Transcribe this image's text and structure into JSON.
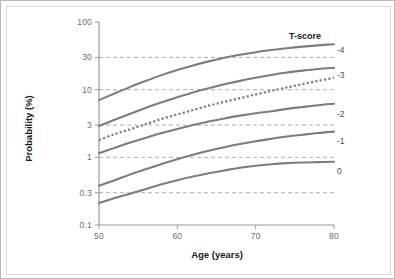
{
  "figure": {
    "border_color": "#b9b9b9",
    "inner_border_color": "#d8d8d8",
    "background": "#ffffff"
  },
  "legend": {
    "title": "T-score"
  },
  "chart_data": {
    "type": "line",
    "title": "",
    "subtitle": "",
    "xlabel": "Age (years)",
    "ylabel": "Probability (%)",
    "xlim": [
      50,
      80
    ],
    "ylim": [
      0.1,
      100
    ],
    "yscale": "log",
    "xscale": "linear",
    "grid": "horizontal-dashed",
    "grid_color": "#8c8c8c",
    "gridlines_y": [
      0.3,
      1,
      3,
      10,
      30
    ],
    "legend_position": "right-inline",
    "axis_color": "#9a9a9a",
    "series_color": "#7d7d7d",
    "xticks": [
      50,
      60,
      70,
      80
    ],
    "xtick_labels": [
      "50",
      "60",
      "70",
      "80"
    ],
    "yticks": [
      0.1,
      0.3,
      1,
      3,
      10,
      30,
      100
    ],
    "ytick_labels": [
      "0.1",
      "0.3",
      "1",
      "3",
      "10",
      "30",
      "100"
    ],
    "x": [
      50,
      52,
      54,
      56,
      58,
      60,
      62,
      64,
      66,
      68,
      70,
      72,
      74,
      76,
      78,
      80
    ],
    "series": [
      {
        "name": "-4",
        "label": "-4",
        "style": "solid",
        "color": "#7d7d7d",
        "label_y": 39.0,
        "values": [
          7.0,
          8.8,
          11.0,
          13.5,
          16.4,
          19.5,
          22.8,
          26.2,
          29.6,
          32.8,
          35.8,
          38.5,
          41.0,
          43.2,
          45.2,
          47.0
        ]
      },
      {
        "name": "-3",
        "label": "-3",
        "style": "solid",
        "color": "#7d7d7d",
        "label_y": 16.5,
        "values": [
          2.9,
          3.6,
          4.4,
          5.4,
          6.5,
          7.7,
          9.1,
          10.5,
          12.0,
          13.5,
          15.0,
          16.5,
          17.9,
          19.1,
          20.2,
          21.0
        ]
      },
      {
        "name": "",
        "label": "",
        "style": "dotted",
        "color": "#7d7d7d",
        "label_y": null,
        "values": [
          1.8,
          2.2,
          2.6,
          3.1,
          3.7,
          4.3,
          5.0,
          5.8,
          6.6,
          7.5,
          8.5,
          9.6,
          10.8,
          12.1,
          13.5,
          15.0
        ]
      },
      {
        "name": "-2",
        "label": "-2",
        "style": "solid",
        "color": "#7d7d7d",
        "label_y": 4.3,
        "values": [
          1.15,
          1.38,
          1.65,
          1.95,
          2.28,
          2.63,
          3.0,
          3.38,
          3.76,
          4.13,
          4.48,
          4.8,
          5.2,
          5.55,
          5.9,
          6.2
        ]
      },
      {
        "name": "-1",
        "label": "-1",
        "style": "solid",
        "color": "#7d7d7d",
        "label_y": 1.75,
        "values": [
          0.38,
          0.46,
          0.56,
          0.67,
          0.8,
          0.94,
          1.09,
          1.25,
          1.41,
          1.57,
          1.73,
          1.88,
          2.03,
          2.16,
          2.29,
          2.4
        ]
      },
      {
        "name": "0",
        "label": "0",
        "style": "solid",
        "color": "#7d7d7d",
        "label_y": 0.62,
        "values": [
          0.21,
          0.25,
          0.29,
          0.34,
          0.4,
          0.46,
          0.52,
          0.58,
          0.64,
          0.7,
          0.75,
          0.79,
          0.82,
          0.84,
          0.85,
          0.86
        ]
      }
    ]
  }
}
